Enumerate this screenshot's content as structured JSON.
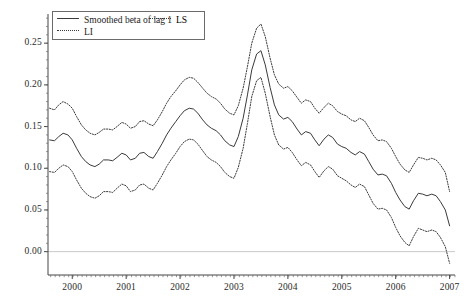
{
  "chart_data": {
    "type": "line",
    "title": "",
    "xlabel": "",
    "ylabel": "",
    "xlim": [
      1999.55,
      2007.1
    ],
    "ylim": [
      -0.028,
      0.285
    ],
    "yticks": [
      0.0,
      0.05,
      0.1,
      0.15,
      0.2,
      0.25
    ],
    "ytick_labels": [
      "0.00",
      "0.05",
      "0.10",
      "0.15",
      "0.20",
      "0.25"
    ],
    "xticks": [
      2000,
      2001,
      2002,
      2003,
      2004,
      2005,
      2006,
      2007
    ],
    "xtick_labels": [
      "2000",
      "2001",
      "2002",
      "2003",
      "2004",
      "2005",
      "2006",
      "2007"
    ],
    "grid": false,
    "zero_line": true,
    "legend_position": "top-left",
    "legend": [
      {
        "label": "Smoothed beta of lag 1",
        "style": "solid"
      },
      {
        "label": "LS",
        "style": "dotted"
      },
      {
        "label": "LI",
        "style": "dotted"
      }
    ],
    "series": [
      {
        "name": "LS",
        "style": "dotted",
        "color": "#3a3a3a",
        "x": [
          1999.58,
          1999.67,
          1999.75,
          1999.83,
          1999.92,
          2000.0,
          2000.08,
          2000.17,
          2000.25,
          2000.33,
          2000.42,
          2000.5,
          2000.58,
          2000.67,
          2000.75,
          2000.83,
          2000.92,
          2001.0,
          2001.08,
          2001.17,
          2001.25,
          2001.33,
          2001.42,
          2001.5,
          2001.58,
          2001.67,
          2001.75,
          2001.83,
          2001.92,
          2002.0,
          2002.08,
          2002.17,
          2002.25,
          2002.33,
          2002.42,
          2002.5,
          2002.58,
          2002.67,
          2002.75,
          2002.83,
          2002.92,
          2003.0,
          2003.08,
          2003.17,
          2003.25,
          2003.33,
          2003.42,
          2003.5,
          2003.58,
          2003.67,
          2003.75,
          2003.83,
          2003.92,
          2004.0,
          2004.08,
          2004.17,
          2004.25,
          2004.33,
          2004.42,
          2004.5,
          2004.58,
          2004.67,
          2004.75,
          2004.83,
          2004.92,
          2005.0,
          2005.08,
          2005.17,
          2005.25,
          2005.33,
          2005.42,
          2005.5,
          2005.58,
          2005.67,
          2005.75,
          2005.83,
          2005.92,
          2006.0,
          2006.08,
          2006.17,
          2006.25,
          2006.33,
          2006.42,
          2006.5,
          2006.58,
          2006.67,
          2006.75,
          2006.83,
          2006.92,
          2007.0
        ],
        "y": [
          0.172,
          0.17,
          0.176,
          0.18,
          0.177,
          0.172,
          0.162,
          0.152,
          0.146,
          0.142,
          0.14,
          0.143,
          0.147,
          0.147,
          0.146,
          0.15,
          0.155,
          0.153,
          0.148,
          0.15,
          0.156,
          0.157,
          0.153,
          0.151,
          0.158,
          0.168,
          0.178,
          0.186,
          0.193,
          0.2,
          0.206,
          0.209,
          0.208,
          0.203,
          0.196,
          0.19,
          0.186,
          0.183,
          0.178,
          0.171,
          0.166,
          0.164,
          0.175,
          0.196,
          0.222,
          0.25,
          0.268,
          0.273,
          0.258,
          0.232,
          0.212,
          0.201,
          0.196,
          0.198,
          0.193,
          0.185,
          0.178,
          0.182,
          0.18,
          0.172,
          0.166,
          0.173,
          0.178,
          0.175,
          0.168,
          0.165,
          0.163,
          0.158,
          0.156,
          0.16,
          0.157,
          0.149,
          0.14,
          0.133,
          0.134,
          0.132,
          0.124,
          0.114,
          0.105,
          0.098,
          0.095,
          0.104,
          0.113,
          0.112,
          0.11,
          0.112,
          0.11,
          0.104,
          0.095,
          0.072
        ]
      },
      {
        "name": "Smoothed beta of lag 1",
        "style": "solid",
        "color": "#3a3a3a",
        "x": [
          1999.58,
          1999.67,
          1999.75,
          1999.83,
          1999.92,
          2000.0,
          2000.08,
          2000.17,
          2000.25,
          2000.33,
          2000.42,
          2000.5,
          2000.58,
          2000.67,
          2000.75,
          2000.83,
          2000.92,
          2001.0,
          2001.08,
          2001.17,
          2001.25,
          2001.33,
          2001.42,
          2001.5,
          2001.58,
          2001.67,
          2001.75,
          2001.83,
          2001.92,
          2002.0,
          2002.08,
          2002.17,
          2002.25,
          2002.33,
          2002.42,
          2002.5,
          2002.58,
          2002.67,
          2002.75,
          2002.83,
          2002.92,
          2003.0,
          2003.08,
          2003.17,
          2003.25,
          2003.33,
          2003.42,
          2003.5,
          2003.58,
          2003.67,
          2003.75,
          2003.83,
          2003.92,
          2004.0,
          2004.08,
          2004.17,
          2004.25,
          2004.33,
          2004.42,
          2004.5,
          2004.58,
          2004.67,
          2004.75,
          2004.83,
          2004.92,
          2005.0,
          2005.08,
          2005.17,
          2005.25,
          2005.33,
          2005.42,
          2005.5,
          2005.58,
          2005.67,
          2005.75,
          2005.83,
          2005.92,
          2006.0,
          2006.08,
          2006.17,
          2006.25,
          2006.33,
          2006.42,
          2006.5,
          2006.58,
          2006.67,
          2006.75,
          2006.83,
          2006.92,
          2007.0
        ],
        "y": [
          0.134,
          0.133,
          0.138,
          0.142,
          0.14,
          0.134,
          0.124,
          0.114,
          0.108,
          0.104,
          0.102,
          0.105,
          0.11,
          0.11,
          0.109,
          0.113,
          0.118,
          0.116,
          0.11,
          0.112,
          0.118,
          0.119,
          0.114,
          0.112,
          0.12,
          0.13,
          0.14,
          0.148,
          0.156,
          0.163,
          0.169,
          0.172,
          0.171,
          0.166,
          0.158,
          0.152,
          0.148,
          0.145,
          0.14,
          0.133,
          0.128,
          0.126,
          0.138,
          0.16,
          0.188,
          0.218,
          0.237,
          0.241,
          0.224,
          0.197,
          0.176,
          0.164,
          0.159,
          0.161,
          0.156,
          0.147,
          0.14,
          0.144,
          0.142,
          0.134,
          0.127,
          0.135,
          0.14,
          0.137,
          0.129,
          0.126,
          0.124,
          0.119,
          0.116,
          0.12,
          0.117,
          0.108,
          0.099,
          0.092,
          0.093,
          0.091,
          0.082,
          0.071,
          0.062,
          0.054,
          0.051,
          0.061,
          0.07,
          0.069,
          0.067,
          0.069,
          0.067,
          0.06,
          0.05,
          0.031
        ]
      },
      {
        "name": "LI",
        "style": "dotted",
        "color": "#3a3a3a",
        "x": [
          1999.58,
          1999.67,
          1999.75,
          1999.83,
          1999.92,
          2000.0,
          2000.08,
          2000.17,
          2000.25,
          2000.33,
          2000.42,
          2000.5,
          2000.58,
          2000.67,
          2000.75,
          2000.83,
          2000.92,
          2001.0,
          2001.08,
          2001.17,
          2001.25,
          2001.33,
          2001.42,
          2001.5,
          2001.58,
          2001.67,
          2001.75,
          2001.83,
          2001.92,
          2002.0,
          2002.08,
          2002.17,
          2002.25,
          2002.33,
          2002.42,
          2002.5,
          2002.58,
          2002.67,
          2002.75,
          2002.83,
          2002.92,
          2003.0,
          2003.08,
          2003.17,
          2003.25,
          2003.33,
          2003.42,
          2003.5,
          2003.58,
          2003.67,
          2003.75,
          2003.83,
          2003.92,
          2004.0,
          2004.08,
          2004.17,
          2004.25,
          2004.33,
          2004.42,
          2004.5,
          2004.58,
          2004.67,
          2004.75,
          2004.83,
          2004.92,
          2005.0,
          2005.08,
          2005.17,
          2005.25,
          2005.33,
          2005.42,
          2005.5,
          2005.58,
          2005.67,
          2005.75,
          2005.83,
          2005.92,
          2006.0,
          2006.08,
          2006.17,
          2006.25,
          2006.33,
          2006.42,
          2006.5,
          2006.58,
          2006.67,
          2006.75,
          2006.83,
          2006.92,
          2007.0
        ],
        "y": [
          0.096,
          0.095,
          0.1,
          0.104,
          0.102,
          0.096,
          0.086,
          0.076,
          0.07,
          0.066,
          0.064,
          0.067,
          0.072,
          0.072,
          0.071,
          0.076,
          0.081,
          0.079,
          0.072,
          0.074,
          0.08,
          0.081,
          0.076,
          0.074,
          0.082,
          0.092,
          0.102,
          0.11,
          0.118,
          0.126,
          0.132,
          0.135,
          0.134,
          0.129,
          0.121,
          0.114,
          0.11,
          0.107,
          0.102,
          0.095,
          0.09,
          0.088,
          0.101,
          0.124,
          0.154,
          0.186,
          0.205,
          0.209,
          0.19,
          0.162,
          0.14,
          0.128,
          0.123,
          0.125,
          0.119,
          0.11,
          0.103,
          0.107,
          0.104,
          0.096,
          0.089,
          0.097,
          0.102,
          0.099,
          0.091,
          0.088,
          0.085,
          0.08,
          0.077,
          0.081,
          0.078,
          0.068,
          0.058,
          0.051,
          0.052,
          0.05,
          0.041,
          0.029,
          0.019,
          0.011,
          0.007,
          0.018,
          0.028,
          0.026,
          0.024,
          0.026,
          0.024,
          0.017,
          0.006,
          -0.014
        ]
      }
    ]
  },
  "axes": {
    "y_tick_labels": [
      "0.25",
      "0.20",
      "0.15",
      "0.10",
      "0.05",
      "0.00"
    ],
    "x_tick_labels": [
      "2000",
      "2001",
      "2002",
      "2003",
      "2004",
      "2005",
      "2006",
      "2007"
    ]
  },
  "legend": {
    "item1": "Smoothed beta of lag 1",
    "item2": "LS",
    "item3": "LI"
  }
}
